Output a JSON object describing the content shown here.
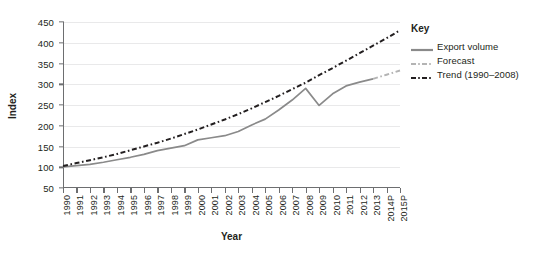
{
  "chart_data": {
    "type": "line",
    "title": "",
    "xlabel": "Year",
    "ylabel": "Index",
    "ylim": [
      50,
      450
    ],
    "ytick_values": [
      50,
      100,
      150,
      200,
      250,
      300,
      350,
      400,
      450
    ],
    "grid": true,
    "legend_position": "right",
    "legend_title": "Key",
    "categories": [
      "1990",
      "1991",
      "1992",
      "1993",
      "1994",
      "1995",
      "1996",
      "1997",
      "1998",
      "1999",
      "2000",
      "2001",
      "2002",
      "2003",
      "2004",
      "2005",
      "2006",
      "2007",
      "2008",
      "2009",
      "2010",
      "2011",
      "2012",
      "2013",
      "2014P",
      "2015P"
    ],
    "series": [
      {
        "name": "Export volume",
        "style": "solid",
        "color": "#8a8a8a",
        "x": [
          "1990",
          "1991",
          "1992",
          "1993",
          "1994",
          "1995",
          "1996",
          "1997",
          "1998",
          "1999",
          "2000",
          "2001",
          "2002",
          "2003",
          "2004",
          "2005",
          "2006",
          "2007",
          "2008",
          "2009",
          "2010",
          "2011",
          "2012",
          "2013"
        ],
        "values": [
          101,
          104,
          107,
          112,
          118,
          124,
          131,
          140,
          146,
          152,
          166,
          171,
          176,
          186,
          202,
          216,
          238,
          262,
          290,
          249,
          277,
          296,
          305,
          313
        ]
      },
      {
        "name": "Forecast",
        "style": "dash-dot",
        "color": "#b4b4b4",
        "x": [
          "2013",
          "2014P",
          "2015P"
        ],
        "values": [
          313,
          323,
          333
        ]
      },
      {
        "name": "Trend (1990–2008)",
        "style": "dash-dot",
        "color": "#231f20",
        "x": [
          "1990",
          "1991",
          "1992",
          "1993",
          "1994",
          "1995",
          "1996",
          "1997",
          "1998",
          "1999",
          "2000",
          "2001",
          "2002",
          "2003",
          "2004",
          "2005",
          "2006",
          "2007",
          "2008",
          "2009",
          "2010",
          "2011",
          "2012",
          "2013",
          "2014P",
          "2015P"
        ],
        "values": [
          103,
          110,
          117,
          124,
          132,
          141,
          150,
          159,
          169,
          180,
          191,
          203,
          215,
          228,
          242,
          257,
          272,
          288,
          304,
          322,
          339,
          357,
          375,
          393,
          411,
          430
        ]
      }
    ],
    "annotations": []
  },
  "axes": {
    "y_title": "Index",
    "x_title": "Year"
  },
  "legend": {
    "title": "Key",
    "items": [
      {
        "label": "Export volume",
        "swatch": "solid-line-swatch"
      },
      {
        "label": "Forecast",
        "swatch": "dash-dot-light-line-swatch"
      },
      {
        "label": "Trend (1990–2008)",
        "swatch": "dash-dot-dark-line-swatch"
      }
    ]
  },
  "colors": {
    "export_volume": "#8a8a8a",
    "forecast": "#b4b4b4",
    "trend": "#231f20",
    "axis": "#6d6e70",
    "grid": "#e9e9ea",
    "text": "#231f20"
  }
}
